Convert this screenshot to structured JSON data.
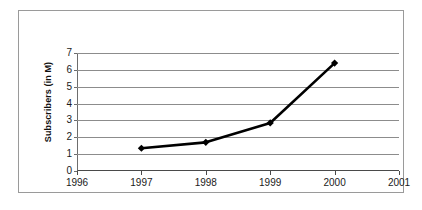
{
  "chart_data": {
    "type": "line",
    "title": "",
    "xlabel": "",
    "ylabel": "Subscribers (in M)",
    "x": [
      1997,
      1998,
      1999,
      2000
    ],
    "values": [
      1.35,
      1.7,
      2.85,
      6.4
    ],
    "series": [
      {
        "name": "Subscribers",
        "values": [
          1.35,
          1.7,
          2.85,
          6.4
        ],
        "color": "#000000",
        "marker": "diamond"
      }
    ],
    "x_tick_labels": [
      "1996",
      "1997",
      "1998",
      "1999",
      "2000",
      "2001"
    ],
    "x_tick_values": [
      1996,
      1997,
      1998,
      1999,
      2000,
      2001
    ],
    "xlim": [
      1996,
      2001
    ],
    "y_tick_labels": [
      "0",
      "1",
      "2",
      "3",
      "4",
      "5",
      "6",
      "7"
    ],
    "y_tick_values": [
      0,
      1,
      2,
      3,
      4,
      5,
      6,
      7
    ],
    "ylim": [
      0,
      7
    ],
    "grid": "horizontal",
    "legend": "none",
    "colors": {
      "line": "#000000",
      "marker": "#000000",
      "gridline": "#8c8c8c",
      "axis": "#4a4a4a",
      "border": "#9a9a9a",
      "background": "#ffffff",
      "text": "#1a1a1a"
    }
  }
}
